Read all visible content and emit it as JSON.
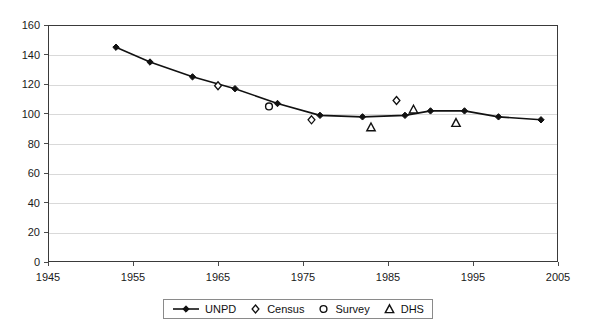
{
  "chart_data": {
    "type": "line",
    "title": "",
    "xlabel": "",
    "ylabel": "",
    "xlim": [
      1945,
      2005
    ],
    "ylim": [
      0,
      160
    ],
    "grid": true,
    "legend_position": "bottom",
    "xticks": [
      1945,
      1955,
      1965,
      1975,
      1985,
      1995,
      2005
    ],
    "yticks": [
      0,
      20,
      40,
      60,
      80,
      100,
      120,
      140,
      160
    ],
    "series": [
      {
        "name": "UNPD",
        "marker": "filled-diamond",
        "style": "line-with-markers",
        "points": [
          {
            "x": 1953,
            "y": 145
          },
          {
            "x": 1957,
            "y": 135
          },
          {
            "x": 1962,
            "y": 125
          },
          {
            "x": 1967,
            "y": 117
          },
          {
            "x": 1972,
            "y": 107
          },
          {
            "x": 1977,
            "y": 99
          },
          {
            "x": 1982,
            "y": 98
          },
          {
            "x": 1987,
            "y": 99
          },
          {
            "x": 1990,
            "y": 102
          },
          {
            "x": 1994,
            "y": 102
          },
          {
            "x": 1998,
            "y": 98
          },
          {
            "x": 2003,
            "y": 96
          }
        ]
      },
      {
        "name": "Census",
        "marker": "open-diamond",
        "style": "markers-only",
        "points": [
          {
            "x": 1965,
            "y": 119
          },
          {
            "x": 1976,
            "y": 96
          },
          {
            "x": 1986,
            "y": 109
          }
        ]
      },
      {
        "name": "Survey",
        "marker": "open-circle",
        "style": "markers-only",
        "points": [
          {
            "x": 1971,
            "y": 105
          }
        ]
      },
      {
        "name": "DHS",
        "marker": "open-triangle",
        "style": "markers-only",
        "points": [
          {
            "x": 1983,
            "y": 91
          },
          {
            "x": 1988,
            "y": 103
          },
          {
            "x": 1993,
            "y": 94
          }
        ]
      }
    ]
  },
  "legend": {
    "items": [
      {
        "label": "UNPD",
        "glyph": "line-diamond-icon"
      },
      {
        "label": "Census",
        "glyph": "open-diamond-icon"
      },
      {
        "label": "Survey",
        "glyph": "open-circle-icon"
      },
      {
        "label": "DHS",
        "glyph": "open-triangle-icon"
      }
    ]
  }
}
